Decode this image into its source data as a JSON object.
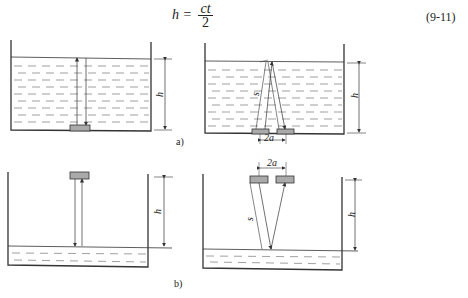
{
  "formula": {
    "lhs": "h =",
    "numerator": "ct",
    "denominator": "2",
    "equation_number": "(9-11)"
  },
  "panels": {
    "a": {
      "caption": "a)",
      "height_label": "h",
      "path_label": "s",
      "spacing_label": "2a"
    },
    "b": {
      "caption": "b)",
      "height_label": "h",
      "path_label": "s",
      "spacing_label": "2a"
    }
  },
  "colors": {
    "line": "#333333",
    "transducer_fill": "#aaaaaa",
    "dash": "#666666"
  }
}
